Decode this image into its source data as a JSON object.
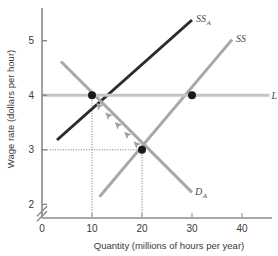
{
  "chart_data": {
    "type": "line",
    "title": "",
    "xlabel": "Quantity (millions of hours per year)",
    "ylabel": "Wage rate (dollars per hour)",
    "xlim": [
      0,
      46
    ],
    "ylim": [
      1.75,
      5.6
    ],
    "xticks": [
      0,
      10,
      20,
      30,
      40
    ],
    "xtick_labels": [
      "0",
      "10",
      "20",
      "30",
      "40"
    ],
    "yticks": [
      2,
      3,
      4,
      5
    ],
    "ytick_labels": [
      "2",
      "3",
      "4",
      "5"
    ],
    "grid": false,
    "legend": "inline-curve-labels",
    "axis_break": {
      "axis": "y",
      "between": [
        0,
        2
      ],
      "style": "double-slash"
    },
    "series": [
      {
        "name": "SS_A",
        "label": "SS",
        "label_sub": "A",
        "role": "short-run supply after tax",
        "color": "#2b2b2b",
        "width": 3,
        "points": [
          [
            3.0,
            3.18
          ],
          [
            30.0,
            5.38
          ]
        ]
      },
      {
        "name": "SS",
        "label": "SS",
        "label_sub": "",
        "role": "short-run supply",
        "color": "#a8a8a8",
        "width": 3,
        "points": [
          [
            11.5,
            2.14
          ],
          [
            38.0,
            5.02
          ]
        ]
      },
      {
        "name": "D_A",
        "label": "D",
        "label_sub": "A",
        "role": "demand",
        "color": "#a8a8a8",
        "width": 3,
        "points": [
          [
            3.8,
            4.62
          ],
          [
            30.0,
            2.22
          ]
        ]
      },
      {
        "name": "LS",
        "label": "LS",
        "label_sub": "",
        "role": "long-run supply",
        "color": "#c4c4c4",
        "width": 3,
        "points": [
          [
            0.0,
            4.0
          ],
          [
            45.5,
            4.0
          ]
        ]
      }
    ],
    "points_marked": [
      {
        "name": "equilibrium-short-run",
        "x": 10,
        "y": 4,
        "color": "#1a1a1a",
        "r": 4
      },
      {
        "name": "equilibrium-low-wage",
        "x": 20,
        "y": 3,
        "color": "#1a1a1a",
        "r": 4
      },
      {
        "name": "equilibrium-long-run",
        "x": 30,
        "y": 4,
        "color": "#1a1a1a",
        "r": 4
      }
    ],
    "guide_lines": [
      {
        "name": "guide-x-10",
        "orient": "vertical",
        "value": 10,
        "from": 0,
        "to": 4
      },
      {
        "name": "guide-x-20",
        "orient": "vertical",
        "value": 20,
        "from": 0,
        "to": 3
      },
      {
        "name": "guide-y-3",
        "orient": "horizontal",
        "value": 3,
        "from": 0,
        "to": 20
      }
    ],
    "adjustment_arrows": {
      "name": "adjustment-path",
      "along": "D_A",
      "from": [
        20,
        3
      ],
      "to": [
        10.6,
        3.88
      ],
      "direction": "up-left",
      "count": 5,
      "color": "#a0a0a0"
    }
  }
}
